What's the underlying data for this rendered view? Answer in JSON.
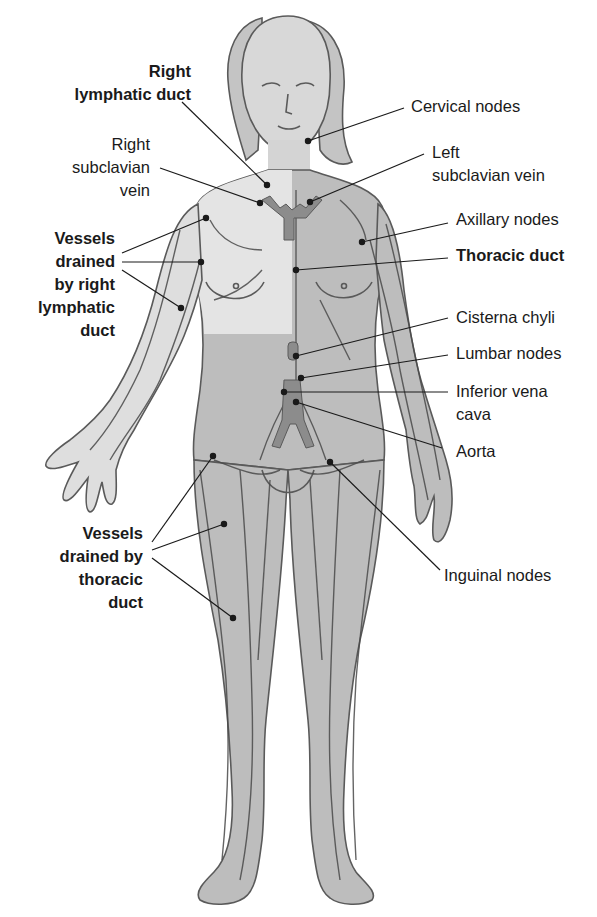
{
  "diagram": {
    "type": "anatomical-illustration",
    "colors": {
      "background": "#ffffff",
      "skin_light": "#e6e6e6",
      "skin_dark": "#bdbdbd",
      "vessel": "#4a4a4a",
      "duct": "#8c8c8c",
      "leader_line": "#1a1a1a",
      "text": "#1a1a1a"
    },
    "labels": {
      "right_lymphatic_duct": {
        "text": "Right\nlymphatic duct",
        "bold": true
      },
      "right_subclavian_vein": {
        "text": "Right\nsubclavian\nvein",
        "bold": false
      },
      "vessels_right": {
        "text": "Vessels\ndrained\nby right\nlymphatic\nduct",
        "bold": true
      },
      "vessels_thoracic": {
        "text": "Vessels\ndrained by\nthoracic\nduct",
        "bold": true
      },
      "cervical_nodes": {
        "text": "Cervical nodes",
        "bold": false
      },
      "left_subclavian_vein": {
        "text": "Left\nsubclavian vein",
        "bold": false
      },
      "axillary_nodes": {
        "text": "Axillary nodes",
        "bold": false
      },
      "thoracic_duct": {
        "text": "Thoracic duct",
        "bold": true
      },
      "cisterna_chyli": {
        "text": "Cisterna chyli",
        "bold": false
      },
      "lumbar_nodes": {
        "text": "Lumbar nodes",
        "bold": false
      },
      "inferior_vena_cava": {
        "text": "Inferior vena\ncava",
        "bold": false
      },
      "aorta": {
        "text": "Aorta",
        "bold": false
      },
      "inguinal_nodes": {
        "text": "Inguinal nodes",
        "bold": false
      }
    }
  }
}
